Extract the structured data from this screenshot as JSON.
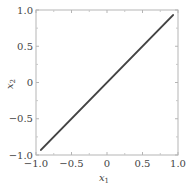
{
  "chart_data": {
    "type": "line",
    "title": "",
    "xlabel": "x1",
    "ylabel": "x2",
    "xlim": [
      -1.0,
      1.0
    ],
    "ylim": [
      -1.0,
      1.0
    ],
    "grid": false,
    "legend": null,
    "x_ticks": [
      -1.0,
      -0.5,
      0,
      0.5,
      1.0
    ],
    "y_ticks": [
      -1.0,
      -0.5,
      0,
      0.5,
      1.0
    ],
    "x_tick_labels": [
      "−1.0",
      "−0.5",
      "0",
      "0.5",
      "1.0"
    ],
    "y_tick_labels": [
      "−1.0",
      "−0.5",
      "0",
      "0.5",
      "1.0"
    ],
    "series": [
      {
        "name": "line",
        "color": "#444444",
        "x": [
          -0.93,
          0.93
        ],
        "y": [
          -0.93,
          0.93
        ]
      }
    ]
  },
  "labels": {
    "x_main": "x",
    "x_sub": "1",
    "y_main": "x",
    "y_sub": "2"
  }
}
